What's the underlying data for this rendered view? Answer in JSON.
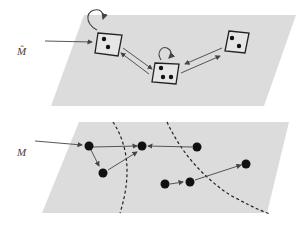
{
  "labels": {
    "top_plane": "M̂",
    "bottom_plane": "M"
  },
  "colors": {
    "plane": "#dcdcdc",
    "ink": "#222222",
    "arrow": "#444444"
  },
  "top_plane": {
    "states": [
      {
        "id": "s1",
        "dots": 2,
        "self_loop": true,
        "initial": true
      },
      {
        "id": "s2",
        "dots": 3,
        "self_loop": true,
        "initial": false
      },
      {
        "id": "s3",
        "dots": 2,
        "self_loop": false,
        "initial": false
      }
    ],
    "transitions": [
      [
        "s1",
        "s2"
      ],
      [
        "s2",
        "s1"
      ],
      [
        "s2",
        "s3"
      ],
      [
        "s3",
        "s2"
      ]
    ]
  },
  "bottom_plane": {
    "nodes": 8,
    "partitions": 3,
    "transitions": [
      [
        "a",
        "b"
      ],
      [
        "a",
        "c"
      ],
      [
        "c",
        "b"
      ],
      [
        "d",
        "b"
      ],
      [
        "e",
        "f"
      ],
      [
        "f",
        "g"
      ]
    ]
  }
}
